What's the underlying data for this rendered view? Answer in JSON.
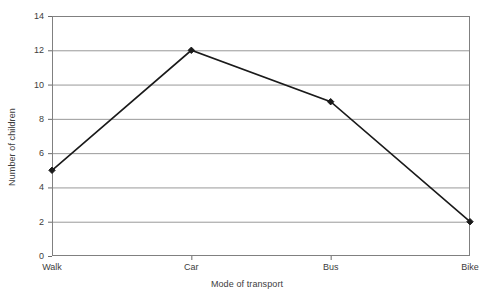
{
  "chart_data": {
    "type": "line",
    "title": "",
    "xlabel": "Mode of transport",
    "ylabel": "Number of children",
    "categories": [
      "Walk",
      "Car",
      "Bus",
      "Bike"
    ],
    "values": [
      5,
      12,
      9,
      2
    ],
    "series": [
      {
        "name": "Number of children",
        "values": [
          5,
          12,
          9,
          2
        ]
      }
    ],
    "ylim": [
      0,
      14
    ],
    "yticks": [
      0,
      2,
      4,
      6,
      8,
      10,
      12,
      14
    ],
    "ytick_labels": [
      "0",
      "2",
      "4",
      "6",
      "8",
      "10",
      "12",
      "14"
    ],
    "grid": "horizontal",
    "legend": "none",
    "line_color": "#1a1a1a",
    "marker": "diamond",
    "marker_color": "#1a1a1a",
    "grid_color": "#999999",
    "border_color": "#808080",
    "background": "#ffffff"
  }
}
